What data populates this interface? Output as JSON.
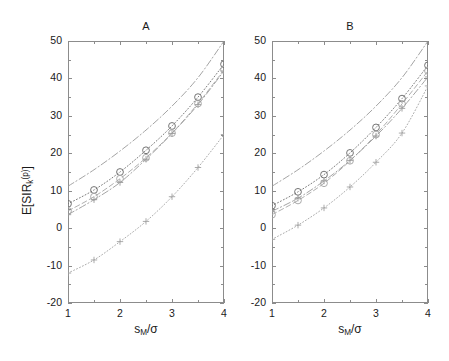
{
  "figure": {
    "width": 449,
    "height": 361,
    "background": "#ffffff",
    "axis_color": "#8c8c8c",
    "text_color": "#1a1a1a"
  },
  "axis_labels": {
    "xlabel_parts": {
      "base": "s",
      "sub": "M",
      "slash": "/",
      "sigma": "σ"
    },
    "xlabel_plain": "s_M/σ",
    "ylabel_parts": {
      "prefix": "E[SIR",
      "sub": "k",
      "sup": "(p)",
      "suffix": "]"
    },
    "ylabel_plain": "E[SIR_k^(p)]"
  },
  "ticks": {
    "y_labels": [
      "50",
      "40",
      "30",
      "20",
      "10",
      "0",
      "-10",
      "-20"
    ],
    "y_values": [
      50,
      40,
      30,
      20,
      10,
      0,
      -10,
      -20
    ],
    "x_labels": [
      "1",
      "2",
      "3",
      "4"
    ],
    "x_values": [
      1,
      2,
      3,
      4
    ],
    "x_minor_values": [
      1.5,
      2.5,
      3.5
    ],
    "y_minor_values": [
      45,
      35,
      25,
      15,
      5,
      -5,
      -15
    ]
  },
  "chart_data": [
    {
      "id": "panel-a",
      "type": "line",
      "title": "A",
      "xlabel": "s_M/σ",
      "ylabel": "E[SIR_k^(p)]",
      "xlim": [
        1,
        4
      ],
      "ylim": [
        -20,
        50
      ],
      "grid": false,
      "legend": "none",
      "x": [
        1,
        1.5,
        2,
        2.5,
        3,
        3.5,
        4
      ],
      "series": [
        {
          "name": "upper-bound",
          "style": "dashdot",
          "marker": "none",
          "color": "#9a9a9a",
          "values": [
            11.2,
            15.6,
            20.6,
            26.2,
            32.6,
            40.2,
            50.0
          ]
        },
        {
          "name": "analysis-circle-dotted",
          "style": "dotted",
          "marker": "circle",
          "color": "#6e6e6e",
          "values": [
            6.5,
            10.2,
            15.0,
            20.8,
            27.3,
            35.0,
            43.8
          ]
        },
        {
          "name": "simulation-circle-dashed",
          "style": "dashed",
          "marker": "circle",
          "color": "#a6a6a6",
          "values": [
            4.6,
            8.4,
            13.2,
            18.8,
            25.4,
            33.3,
            42.3
          ]
        },
        {
          "name": "analysis-plus-dashdot",
          "style": "dashdot",
          "marker": "plus",
          "color": "#9a9a9a",
          "values": [
            3.6,
            7.6,
            12.2,
            18.4,
            25.3,
            33.0,
            42.0
          ]
        },
        {
          "name": "lower-plus-dotted",
          "style": "dotted",
          "marker": "plus",
          "color": "#a2a2a2",
          "values": [
            -12.0,
            -8.5,
            -3.6,
            1.8,
            8.4,
            16.2,
            25.0
          ]
        }
      ]
    },
    {
      "id": "panel-b",
      "type": "line",
      "title": "B",
      "xlabel": "s_M/σ",
      "ylabel": "E[SIR_k^(p)]",
      "xlim": [
        1,
        4
      ],
      "ylim": [
        -20,
        50
      ],
      "grid": false,
      "legend": "none",
      "x": [
        1,
        1.5,
        2,
        2.5,
        3,
        3.5,
        4
      ],
      "series": [
        {
          "name": "upper-bound",
          "style": "dashdot",
          "marker": "none",
          "color": "#9a9a9a",
          "values": [
            11.2,
            15.6,
            20.6,
            26.2,
            32.6,
            40.2,
            50.0
          ]
        },
        {
          "name": "analysis-circle-dotted",
          "style": "dotted",
          "marker": "circle",
          "color": "#6e6e6e",
          "values": [
            6.0,
            9.7,
            14.3,
            20.1,
            26.9,
            34.6,
            43.5
          ]
        },
        {
          "name": "simulation-circle-dashed",
          "style": "dashed",
          "marker": "circle",
          "color": "#a6a6a6",
          "values": [
            3.6,
            7.4,
            12.0,
            18.0,
            25.0,
            33.2,
            42.0
          ]
        },
        {
          "name": "analysis-plus-dashdot",
          "style": "dashdot",
          "marker": "plus",
          "color": "#9a9a9a",
          "values": [
            4.5,
            8.0,
            12.6,
            18.1,
            24.6,
            32.0,
            40.4
          ]
        },
        {
          "name": "lower-plus-dotted",
          "style": "dotted",
          "marker": "plus",
          "color": "#a2a2a2",
          "values": [
            -3.0,
            0.8,
            5.4,
            11.0,
            17.6,
            25.4,
            38.0
          ]
        }
      ]
    }
  ]
}
